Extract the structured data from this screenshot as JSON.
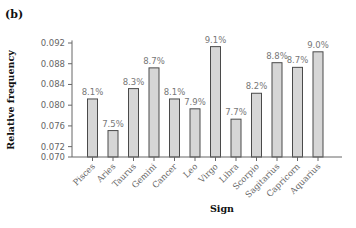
{
  "panel_label": "(b)",
  "chart_data": {
    "type": "bar",
    "title": "",
    "xlabel": "Sign",
    "ylabel": "Relative frequency",
    "ylim": [
      0.07,
      0.093
    ],
    "yticks": [
      0.07,
      0.072,
      0.076,
      0.08,
      0.084,
      0.088,
      0.092
    ],
    "ytick_labels": [
      "0.070",
      "0.072",
      "0.076",
      "0.080",
      "0.084",
      "0.088",
      "0.092"
    ],
    "grid": false,
    "legend": null,
    "categories": [
      "Pisces",
      "Aries",
      "Taurus",
      "Gemini",
      "Cancer",
      "Leo",
      "Virgo",
      "Libra",
      "Scorpio",
      "Sagitarius",
      "Capricorn",
      "Aquarius"
    ],
    "values": [
      0.0812,
      0.0751,
      0.0832,
      0.0872,
      0.0812,
      0.0793,
      0.0913,
      0.0773,
      0.0823,
      0.0882,
      0.0873,
      0.0903
    ],
    "data_labels": [
      "8.1%",
      "7.5%",
      "8.3%",
      "8.7%",
      "8.1%",
      "7.9%",
      "9.1%",
      "7.7%",
      "8.2%",
      "8.8%",
      "8.7%",
      "9.0%"
    ],
    "colors": {
      "bar_fill": "#d6d6d6",
      "bar_stroke": "#4a4a4a",
      "axis": "#666666"
    }
  }
}
